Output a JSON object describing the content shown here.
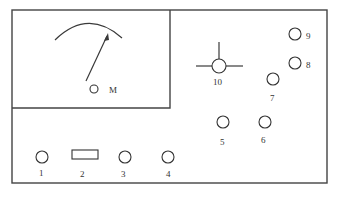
{
  "diagram": {
    "type": "instrument-panel-layout",
    "meter": {
      "label": "M"
    },
    "components": [
      {
        "id": "1",
        "label": "1",
        "shape": "circle"
      },
      {
        "id": "2",
        "label": "2",
        "shape": "rectangle"
      },
      {
        "id": "3",
        "label": "3",
        "shape": "circle"
      },
      {
        "id": "4",
        "label": "4",
        "shape": "circle"
      },
      {
        "id": "5",
        "label": "5",
        "shape": "circle"
      },
      {
        "id": "6",
        "label": "6",
        "shape": "circle"
      },
      {
        "id": "7",
        "label": "7",
        "shape": "circle"
      },
      {
        "id": "8",
        "label": "8",
        "shape": "circle"
      },
      {
        "id": "9",
        "label": "9",
        "shape": "circle"
      },
      {
        "id": "10",
        "label": "10",
        "shape": "circle-with-crosshair"
      }
    ]
  }
}
